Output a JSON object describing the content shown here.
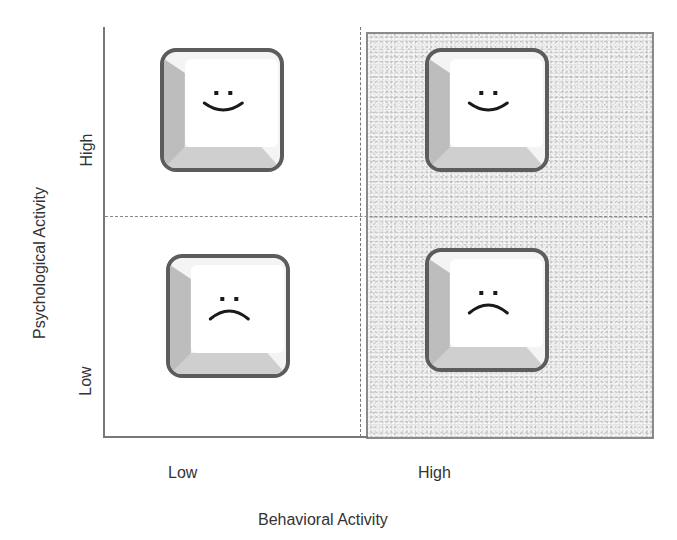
{
  "figure": {
    "x_axis": {
      "title": "Behavioral Activity",
      "ticks": [
        "Low",
        "High"
      ]
    },
    "y_axis": {
      "title": "Psychological Activity",
      "ticks": [
        "Low",
        "High"
      ]
    },
    "shaded_region": "High behavioral activity (right half)",
    "quadrants": [
      {
        "position": "top-left",
        "behavioral": "Low",
        "psychological": "High",
        "face": "smile",
        "icon": "smiley-key-icon"
      },
      {
        "position": "bottom-left",
        "behavioral": "Low",
        "psychological": "Low",
        "face": "frown",
        "icon": "frowny-key-icon"
      },
      {
        "position": "top-right",
        "behavioral": "High",
        "psychological": "High",
        "face": "smile",
        "icon": "smiley-key-icon"
      },
      {
        "position": "bottom-right",
        "behavioral": "High",
        "psychological": "Low",
        "face": "frown",
        "icon": "frowny-key-icon"
      }
    ],
    "colors": {
      "axis": "#777777",
      "shaded_fill": "#e2e2e2",
      "key_border": "#5c5c5c",
      "key_bevel": "#bdbdbd",
      "key_face": "#ffffff"
    }
  }
}
